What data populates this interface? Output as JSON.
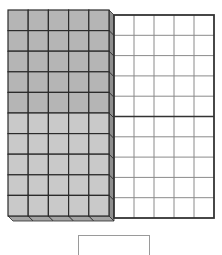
{
  "diagram": {
    "cube_stack": {
      "columns": 5,
      "rows": 10,
      "total_units": 100,
      "upper_rows_shaded": 5,
      "lower_rows_shaded": 5,
      "colors": {
        "upper_fill": "#b5b5b5",
        "lower_fill": "#c9c9c9",
        "side_fill": "#8e8e8e",
        "bottom_fill": "#a3a3a3",
        "line": "#2b2b2b"
      }
    },
    "flat_grid": {
      "columns": 5,
      "rows": 10,
      "divider_after_row": 5,
      "colors": {
        "fill": "#ffffff",
        "grid_line": "#8a8a8a",
        "border": "#333333"
      }
    },
    "answer_box": {
      "value": ""
    }
  }
}
